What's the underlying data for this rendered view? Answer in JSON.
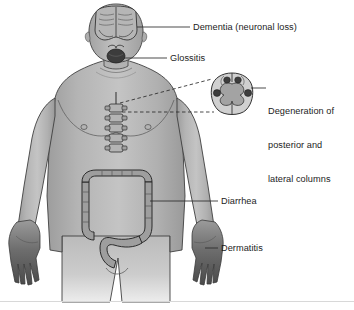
{
  "figure": {
    "background_color": "#ffffff"
  },
  "labels": [
    {
      "id": "dementia",
      "text": "Dementia (neuronal loss)",
      "target": "brain",
      "leader": "solid-line"
    },
    {
      "id": "glossitis",
      "text": "Glossitis",
      "target": "tongue",
      "leader": "solid-line"
    },
    {
      "id": "degeneration",
      "line1": "Degeneration of",
      "line2": "posterior and",
      "line3": "lateral columns",
      "target": "spinal-cord-cross-section",
      "leader": "solid-line"
    },
    {
      "id": "diarrhea",
      "text": "Diarrhea",
      "target": "large-intestine",
      "leader": "solid-line"
    },
    {
      "id": "dermatitis",
      "text": "Dermatitis",
      "target": "hand-skin",
      "leader": "solid-line"
    }
  ],
  "anatomy": {
    "body": "male-figure-torso-head-arms-legs",
    "brain": "coronal-brain-cutaway-in-skull",
    "tongue": "open-mouth-with-dark-tongue",
    "spine": "vertebral-column-segments",
    "intestine": "large-intestine-colon",
    "hands": "both-hands-darkly-shaded",
    "inset": "spinal-cord-cross-section"
  },
  "inset": {
    "name": "spinal-cord-cross-section",
    "connector": "dashed-lines",
    "lesions": 4,
    "lesion_description": "darkened posterior and lateral columns"
  },
  "colors": {
    "body_fill": "#a9a9a9",
    "body_fill_light": "#c2c2c2",
    "body_outline": "#3a3a3a",
    "organ_fill": "#9a9a9a",
    "organ_outline": "#2e2e2e",
    "lesion_dark": "#3d3d3d",
    "inset_outer": "#cfcfcf",
    "inset_gray_matter": "#a6a6a6",
    "label_text": "#1c1c1c",
    "leader_line": "#2a2a2a"
  }
}
